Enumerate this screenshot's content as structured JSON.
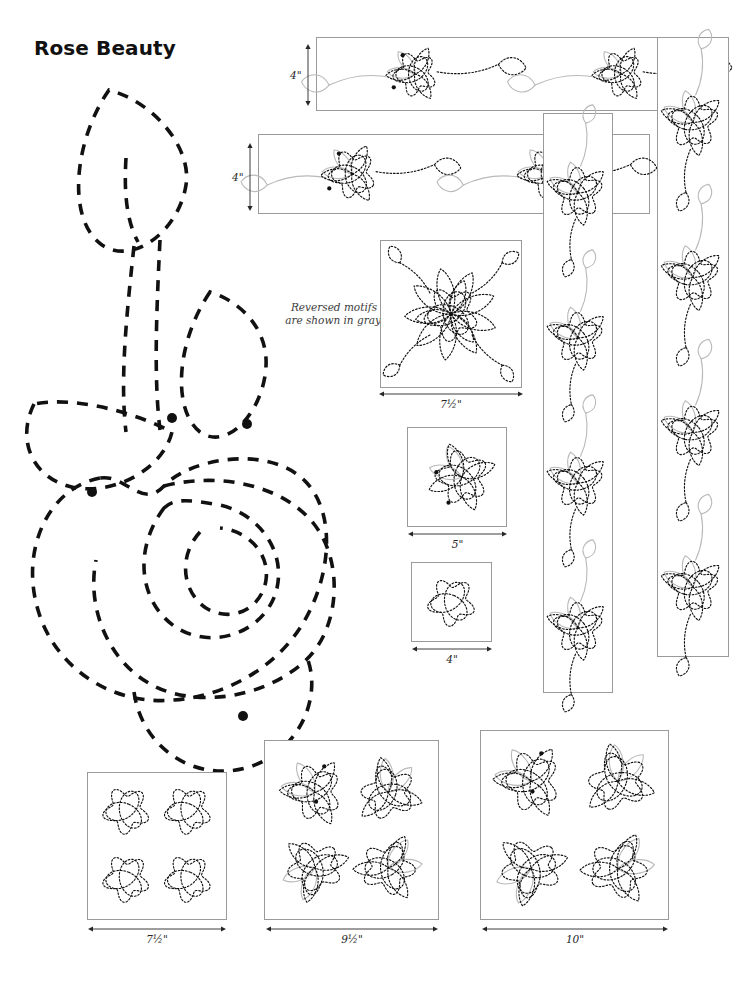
{
  "document": {
    "title": "Rose Beauty",
    "legend_note_line1": "Reversed motifs",
    "legend_note_line2": "are shown in gray."
  },
  "colors": {
    "stitch_black": "#111111",
    "reversed_gray": "#b9b9b9",
    "frame_gray": "#9a9a9a",
    "label_text": "#262626",
    "title_text": "#111111",
    "background": "#ffffff"
  },
  "measurements": [
    {
      "id": "top-border-height",
      "label": "4\"",
      "orientation": "vertical",
      "x": 307,
      "y": 44,
      "length": 62
    },
    {
      "id": "second-border-height",
      "label": "4\"",
      "orientation": "vertical",
      "x": 249,
      "y": 143,
      "length": 68
    },
    {
      "id": "block-75-width",
      "label": "7½\"",
      "orientation": "horizontal",
      "x": 379,
      "y": 393,
      "length": 144
    },
    {
      "id": "block-5-width",
      "label": "5\"",
      "orientation": "horizontal",
      "x": 408,
      "y": 533,
      "length": 99
    },
    {
      "id": "block-4-width",
      "label": "4\"",
      "orientation": "horizontal",
      "x": 412,
      "y": 648,
      "length": 80
    },
    {
      "id": "block-75-grid-width",
      "label": "7½\"",
      "orientation": "horizontal",
      "x": 88,
      "y": 928,
      "length": 138
    },
    {
      "id": "block-95-wreath-width",
      "label": "9½\"",
      "orientation": "horizontal",
      "x": 266,
      "y": 928,
      "length": 172
    },
    {
      "id": "block-10-wreath-width",
      "label": "10\"",
      "orientation": "horizontal",
      "x": 482,
      "y": 928,
      "length": 186
    }
  ],
  "panels": [
    {
      "id": "border-strip-top",
      "name": "border-strip-top",
      "x": 316,
      "y": 37,
      "w": 412,
      "h": 74,
      "kind": "border-horizontal",
      "repeats": 2,
      "size_label": "4\""
    },
    {
      "id": "border-strip-second",
      "name": "border-strip-second",
      "x": 258,
      "y": 134,
      "w": 392,
      "h": 80,
      "kind": "border-horizontal",
      "repeats": 2,
      "size_label": "4\""
    },
    {
      "id": "border-strip-vertical-inner",
      "name": "border-strip-vertical-inner",
      "x": 543,
      "y": 113,
      "w": 70,
      "h": 580,
      "kind": "border-vertical",
      "repeats": 4,
      "size_label": "4\""
    },
    {
      "id": "border-strip-vertical-outer",
      "name": "border-strip-vertical-outer",
      "x": 657,
      "y": 37,
      "w": 72,
      "h": 620,
      "kind": "border-vertical",
      "repeats": 4,
      "size_label": "4\""
    },
    {
      "id": "block-rose-75",
      "name": "block-rose-7-5-inch",
      "x": 380,
      "y": 240,
      "w": 142,
      "h": 148,
      "kind": "block-rose-leaves",
      "size_label": "7½\""
    },
    {
      "id": "block-rose-5",
      "name": "block-rose-5-inch",
      "x": 407,
      "y": 427,
      "w": 100,
      "h": 100,
      "kind": "block-rose-petals",
      "size_label": "5\""
    },
    {
      "id": "block-rose-4",
      "name": "block-rose-4-inch",
      "x": 411,
      "y": 562,
      "w": 81,
      "h": 80,
      "kind": "block-rose-knot",
      "size_label": "4\""
    },
    {
      "id": "block-grid-4rose",
      "name": "block-four-rose-grid",
      "x": 87,
      "y": 772,
      "w": 140,
      "h": 148,
      "kind": "block-grid-4",
      "size_label": "7½\""
    },
    {
      "id": "block-wreath-95",
      "name": "block-rose-wreath-9-5",
      "x": 264,
      "y": 740,
      "w": 175,
      "h": 180,
      "kind": "block-wreath",
      "size_label": "9½\""
    },
    {
      "id": "block-wreath-10",
      "name": "block-rose-wreath-10",
      "x": 480,
      "y": 730,
      "w": 189,
      "h": 190,
      "kind": "block-wreath-open",
      "size_label": "10\""
    }
  ],
  "main_motif": {
    "name": "rose-beauty-master-motif",
    "description": "Large dashed outline of rose with leaf and stem",
    "stitch_dots": 4
  }
}
